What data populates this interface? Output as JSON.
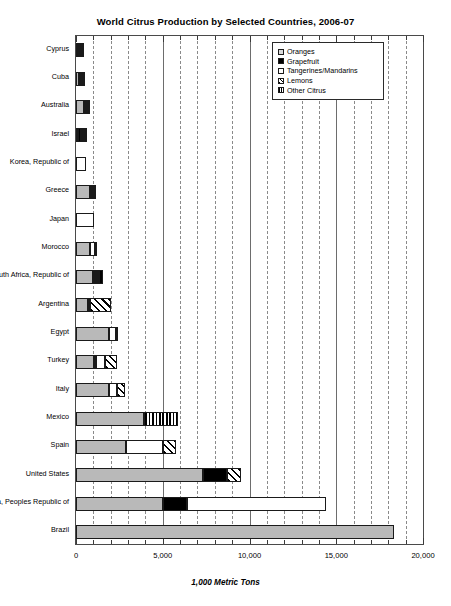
{
  "chart_data": {
    "type": "bar",
    "orientation": "horizontal",
    "stacked": true,
    "title": "World Citrus Production by Selected Countries, 2006-07",
    "xlabel": "1,000 Metric Tons",
    "ylabel": "",
    "xlim": [
      0,
      20000
    ],
    "xticks": [
      0,
      5000,
      10000,
      15000,
      20000
    ],
    "xticklabels": [
      "0",
      "5,000",
      "10,000",
      "15,000",
      "20,000"
    ],
    "minor_tick_step": 1000,
    "grid": true,
    "legend_position": "upper right",
    "legend": [
      "Oranges",
      "Grapefruit",
      "Tangerines/Mandarins",
      "Lemons",
      "Other Citrus"
    ],
    "categories": [
      "Cyprus",
      "Cuba",
      "Australia",
      "Israel",
      "Korea, Republic of",
      "Greece",
      "Japan",
      "Morocco",
      "South Africa, Republic of",
      "Argentina",
      "Egypt",
      "Turkey",
      "Italy",
      "Mexico",
      "Spain",
      "United States",
      "China, Peoples Republic of",
      "Brazil"
    ],
    "series": [
      {
        "name": "Oranges",
        "color": "#b9b9b9",
        "values": [
          75,
          170,
          450,
          95,
          0,
          800,
          0,
          800,
          1000,
          700,
          1900,
          1050,
          1900,
          3900,
          2900,
          7300,
          5000,
          18300
        ]
      },
      {
        "name": "Grapefruit",
        "color": "#000000",
        "values": [
          90,
          80,
          20,
          180,
          0,
          0,
          0,
          0,
          110,
          0,
          0,
          130,
          0,
          0,
          0,
          1400,
          1400,
          0
        ]
      },
      {
        "name": "Tangerines/Mandarins",
        "color": "#ffffff",
        "values": [
          20,
          20,
          70,
          60,
          600,
          30,
          1030,
          320,
          30,
          50,
          400,
          500,
          450,
          0,
          2100,
          0,
          8000,
          0
        ]
      },
      {
        "name": "Lemons",
        "color": "hatch-diagonal",
        "values": [
          30,
          20,
          40,
          40,
          0,
          30,
          0,
          20,
          20,
          1200,
          0,
          700,
          450,
          0,
          750,
          800,
          0,
          0
        ]
      },
      {
        "name": "Other Citrus",
        "color": "hatch-vertical",
        "values": [
          0,
          0,
          0,
          20,
          0,
          140,
          0,
          0,
          200,
          0,
          150,
          0,
          0,
          2000,
          0,
          0,
          0,
          0
        ]
      }
    ],
    "totals": [
      215,
      290,
      580,
      395,
      600,
      1000,
      1030,
      1140,
      1360,
      1950,
      2450,
      2380,
      2800,
      5900,
      5750,
      9500,
      14400,
      18300
    ]
  }
}
